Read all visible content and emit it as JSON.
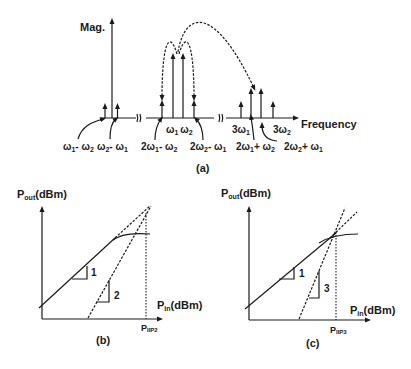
{
  "figure_a": {
    "caption": "(a)",
    "y_axis_label": "Mag.",
    "x_axis_label": "Frequency",
    "tones": [
      {
        "label": "ω1 - ω2",
        "x": 105,
        "height": "small"
      },
      {
        "label": "ω2 - ω1",
        "x": 117,
        "height": "small"
      },
      {
        "label": "DC",
        "x": 112,
        "height": "large"
      },
      {
        "label": "2ω1 - ω2",
        "x": 162,
        "height": "small"
      },
      {
        "label": "ω1",
        "x": 173,
        "height": "large"
      },
      {
        "label": "ω2",
        "x": 183,
        "height": "large"
      },
      {
        "label": "2ω2 - ω1",
        "x": 194,
        "height": "small"
      },
      {
        "label": "3ω1",
        "x": 241,
        "height": "small"
      },
      {
        "label": "2ω1 + ω2",
        "x": 251,
        "height": "medium"
      },
      {
        "label": "2ω2 + ω1",
        "x": 261,
        "height": "medium"
      },
      {
        "label": "3ω2",
        "x": 273,
        "height": "small"
      }
    ],
    "labels": {
      "w1_minus_w2": {
        "base": "ω",
        "sub": "1",
        "rest": "- ω",
        "sub2": "2"
      },
      "w2_minus_w1": {
        "base": "ω",
        "sub": "2",
        "rest": "- ω",
        "sub2": "1"
      },
      "two_w1_minus_w2": {
        "pre": "2ω",
        "sub": "1",
        "rest": "- ω",
        "sub2": "2"
      },
      "two_w2_minus_w1": {
        "pre": "2ω",
        "sub": "2",
        "rest": "- ω",
        "sub2": "1"
      },
      "w1": {
        "base": "ω",
        "sub": "1"
      },
      "w2": {
        "base": "ω",
        "sub": "2"
      },
      "three_w1": {
        "pre": "3ω",
        "sub": "1"
      },
      "three_w2": {
        "pre": "3ω",
        "sub": "2"
      },
      "two_w1_plus_w2": {
        "pre": "2ω",
        "sub": "1",
        "rest": "+ ω",
        "sub2": "2"
      },
      "two_w2_plus_w1": {
        "pre": "2ω",
        "sub": "2",
        "rest": "+ ω",
        "sub2": "1"
      }
    }
  },
  "figure_b": {
    "caption": "(b)",
    "y_axis_label": {
      "main": "P",
      "sub": "out",
      "unit": "(dBm)"
    },
    "x_axis_label": {
      "main": "P",
      "sub": "in",
      "unit": "(dBm)"
    },
    "intercept_label": {
      "main": "P",
      "sub": "IIP2"
    },
    "slope_fundamental": "1",
    "slope_distortion": "2"
  },
  "figure_c": {
    "caption": "(c)",
    "y_axis_label": {
      "main": "P",
      "sub": "out",
      "unit": "(dBm)"
    },
    "x_axis_label": {
      "main": "P",
      "sub": "in",
      "unit": "(dBm)"
    },
    "intercept_label": {
      "main": "P",
      "sub": "IIP3"
    },
    "slope_fundamental": "1",
    "slope_distortion": "3"
  }
}
